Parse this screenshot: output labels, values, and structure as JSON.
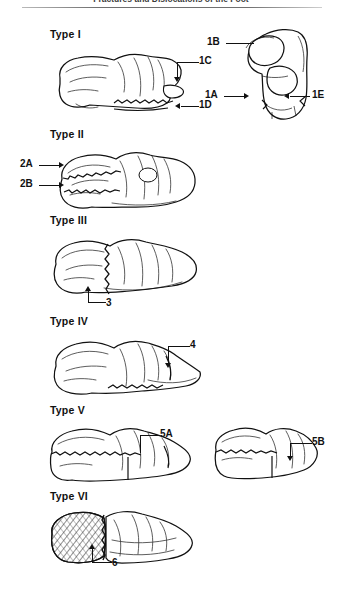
{
  "running_head": "Fractures and Dislocations of the Foot",
  "figure": {
    "type_labels": [
      {
        "id": "type-1",
        "text": "Type I"
      },
      {
        "id": "type-2",
        "text": "Type II"
      },
      {
        "id": "type-3",
        "text": "Type III"
      },
      {
        "id": "type-4",
        "text": "Type IV"
      },
      {
        "id": "type-5",
        "text": "Type V"
      },
      {
        "id": "type-6",
        "text": "Type VI"
      }
    ],
    "callouts": [
      {
        "id": "callout-1a",
        "text": "1A"
      },
      {
        "id": "callout-1b",
        "text": "1B"
      },
      {
        "id": "callout-1c",
        "text": "1C"
      },
      {
        "id": "callout-1d",
        "text": "1D"
      },
      {
        "id": "callout-1e",
        "text": "1E"
      },
      {
        "id": "callout-2a",
        "text": "2A"
      },
      {
        "id": "callout-2b",
        "text": "2B"
      },
      {
        "id": "callout-3",
        "text": "3"
      },
      {
        "id": "callout-4",
        "text": "4"
      },
      {
        "id": "callout-5a",
        "text": "5A"
      },
      {
        "id": "callout-5b",
        "text": "5B"
      },
      {
        "id": "callout-6",
        "text": "6"
      }
    ],
    "colors": {
      "ink": "#111111",
      "paper": "#ffffff",
      "hatch": "#3a3a3a",
      "shade": "#efefef"
    }
  }
}
